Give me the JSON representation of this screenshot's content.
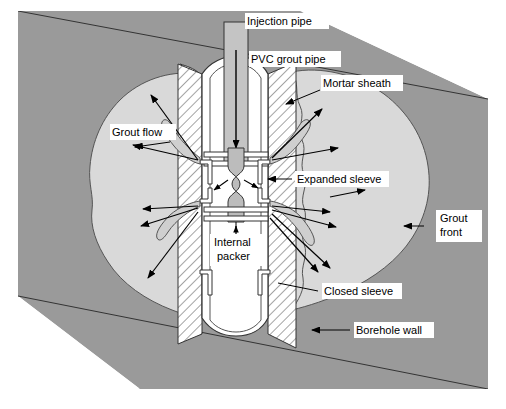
{
  "figure": {
    "frame_color": "#888888",
    "background_color": "#ffffff"
  },
  "colors": {
    "soil_dark": "#9a9a9a",
    "grout_bulb": "#d9d9d9",
    "mortar_sheath_fill": "#ffffff",
    "hatch_line": "#4a4a4a",
    "pipe_fill": "#ffffff",
    "injection_pipe_fill": "#c4c4c4",
    "packer_fill": "#bcbcbc",
    "outline": "#333333",
    "label_text": "#000000",
    "label_box": "#ffffff"
  },
  "labels": [
    {
      "id": "injection-pipe",
      "text": "Injection pipe",
      "x": 247,
      "y": 21,
      "lines": [
        "Injection pipe"
      ]
    },
    {
      "id": "pvc-grout-pipe",
      "text": "PVC grout pipe",
      "x": 251,
      "y": 59,
      "lines": [
        "PVC grout pipe"
      ]
    },
    {
      "id": "mortar-sheath",
      "text": "Mortar sheath",
      "x": 323,
      "y": 83,
      "lines": [
        "Mortar sheath"
      ]
    },
    {
      "id": "grout-flow",
      "text": "Grout flow",
      "x": 112,
      "y": 132,
      "lines": [
        "Grout flow"
      ]
    },
    {
      "id": "expanded-sleeve",
      "text": "Expanded sleeve",
      "x": 297,
      "y": 179,
      "lines": [
        "Expanded sleeve"
      ]
    },
    {
      "id": "grout-front",
      "text": "Grout front",
      "x": 440,
      "y": 226,
      "lines": [
        "Grout",
        "front"
      ]
    },
    {
      "id": "internal-packer",
      "text": "Internal packer",
      "x": 214,
      "y": 245,
      "lines": [
        "Internal",
        "packer"
      ]
    },
    {
      "id": "closed-sleeve",
      "text": "Closed sleeve",
      "x": 324,
      "y": 291,
      "lines": [
        "Closed sleeve"
      ]
    },
    {
      "id": "borehole-wall",
      "text": "Borehole wall",
      "x": 356,
      "y": 330,
      "lines": [
        "Borehole wall"
      ]
    }
  ],
  "components": {
    "injection_pipe": "Injection pipe",
    "pvc_grout_pipe": "PVC grout pipe",
    "mortar_sheath": "Mortar sheath",
    "internal_packer": "Internal packer",
    "expanded_sleeve": "Expanded sleeve",
    "closed_sleeve": "Closed sleeve",
    "borehole_wall": "Borehole wall",
    "grout_front": "Grout front",
    "grout_flow": "Grout flow",
    "soil": "Soil / ground stratum",
    "grout_bulb": "Injected grout bulb"
  }
}
